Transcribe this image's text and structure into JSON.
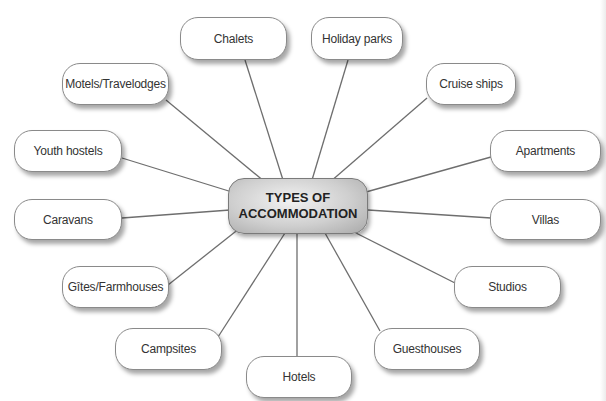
{
  "diagram": {
    "center": {
      "line1": "TYPES OF",
      "line2": "ACCOMMODATION"
    },
    "nodes": [
      {
        "label": "Chalets"
      },
      {
        "label": "Holiday parks"
      },
      {
        "label": "Motels/Travelodges"
      },
      {
        "label": "Cruise ships"
      },
      {
        "label": "Youth hostels"
      },
      {
        "label": "Apartments"
      },
      {
        "label": "Caravans"
      },
      {
        "label": "Villas"
      },
      {
        "label": "Gîtes/Farmhouses"
      },
      {
        "label": "Studios"
      },
      {
        "label": "Campsites"
      },
      {
        "label": "Guesthouses"
      },
      {
        "label": "Hotels"
      }
    ],
    "colors": {
      "line": "#6e6e6e",
      "border": "#8a8a8a",
      "center_fill": "#c8c8c8"
    }
  }
}
